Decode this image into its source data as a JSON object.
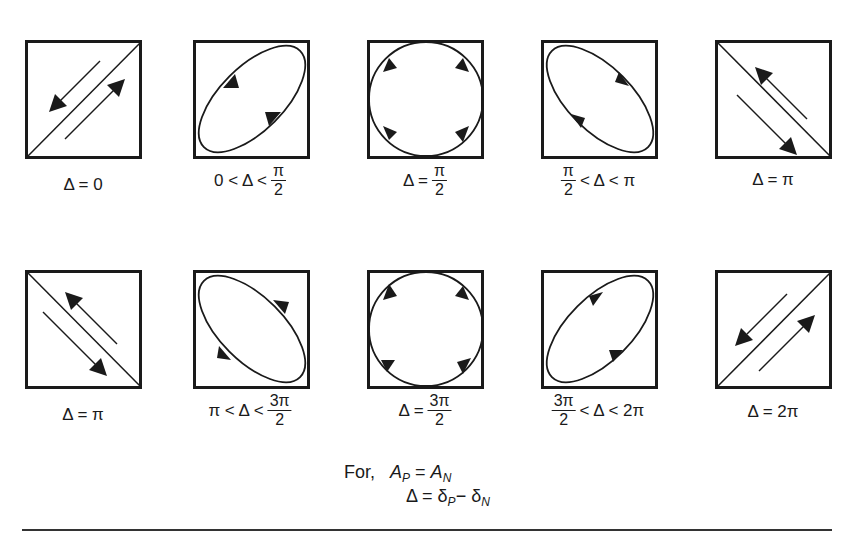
{
  "diagram": {
    "rows": [
      {
        "panels": [
          {
            "shape": "line-pos",
            "direction": "both",
            "label": {
              "text": "Δ = 0"
            }
          },
          {
            "shape": "ellipse-pos",
            "direction": "ccw",
            "label": {
              "pre": "0 < Δ <",
              "num": "π",
              "den": "2"
            }
          },
          {
            "shape": "circle",
            "direction": "ccw",
            "label": {
              "pre": "Δ =",
              "num": "π",
              "den": "2"
            }
          },
          {
            "shape": "ellipse-neg",
            "direction": "ccw",
            "label": {
              "num": "π",
              "den": "2",
              "post": "< Δ < π"
            }
          },
          {
            "shape": "line-neg",
            "direction": "both",
            "label": {
              "text": "Δ = π"
            }
          }
        ]
      },
      {
        "panels": [
          {
            "shape": "line-neg",
            "direction": "both",
            "label": {
              "text": "Δ = π"
            }
          },
          {
            "shape": "ellipse-neg",
            "direction": "cw",
            "label": {
              "pre": "π < Δ <",
              "num": "3π",
              "den": "2"
            }
          },
          {
            "shape": "circle",
            "direction": "cw",
            "label": {
              "pre": "Δ =",
              "num": "3π",
              "den": "2"
            }
          },
          {
            "shape": "ellipse-pos",
            "direction": "cw",
            "label": {
              "num": "3π",
              "den": "2",
              "post": "< Δ < 2π"
            }
          },
          {
            "shape": "line-pos",
            "direction": "both",
            "label": {
              "text": "Δ = 2π"
            }
          }
        ]
      }
    ],
    "footnote": {
      "for": "For,",
      "line1": {
        "A": "A",
        "P": "P",
        "eq": "=",
        "A2": "A",
        "N": "N"
      },
      "line2": {
        "delta": "Δ",
        "eq": "=",
        "d1": "δ",
        "P": "P",
        "minus": "−",
        "d2": "δ",
        "N": "N"
      }
    }
  }
}
